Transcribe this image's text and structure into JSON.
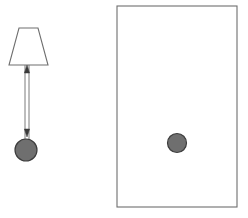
{
  "canvas": {
    "width": 248,
    "height": 218,
    "background": "#ffffff",
    "title": "pendulum-and-container-diagram"
  },
  "style": {
    "outline_color": "#6e6e6e",
    "outline_color_dark": "#555555",
    "shape_fill": "#ffffff",
    "ball_fill": "#6f6f6f",
    "ball_stroke": "#3d3d3d",
    "arrow_color": "#7a7a7a",
    "arrow_head_color": "#3a3a3a",
    "stroke_width": 1.1
  },
  "left_panel": {
    "label": "pendulum-assembly",
    "lampshade": {
      "label": "trapezoid-mount",
      "top_left_x": 19,
      "top_right_x": 38,
      "top_y": 28,
      "bottom_left_x": 9,
      "bottom_right_x": 48,
      "bottom_y": 65,
      "fill": "#ffffff",
      "stroke": "#6e6e6e"
    },
    "rod": {
      "label": "double-headed-arrow-rod",
      "x_left": 25,
      "x_right": 29,
      "top_y": 65,
      "bottom_y": 140,
      "arrow_up_tip_y": 65,
      "arrow_down_tip_y": 137
    },
    "bob": {
      "label": "pendulum-bob-circle",
      "cx": 26,
      "cy": 150,
      "r": 11,
      "fill": "#6f6f6f",
      "stroke": "#3d3d3d"
    }
  },
  "right_panel": {
    "label": "container-rectangle",
    "rect": {
      "x": 117,
      "y": 6,
      "width": 120,
      "height": 201,
      "fill": "#ffffff",
      "stroke": "#6e6e6e"
    },
    "ball": {
      "label": "free-ball-circle",
      "cx": 177,
      "cy": 143,
      "r": 9.5,
      "fill": "#6f6f6f",
      "stroke": "#3d3d3d"
    }
  }
}
